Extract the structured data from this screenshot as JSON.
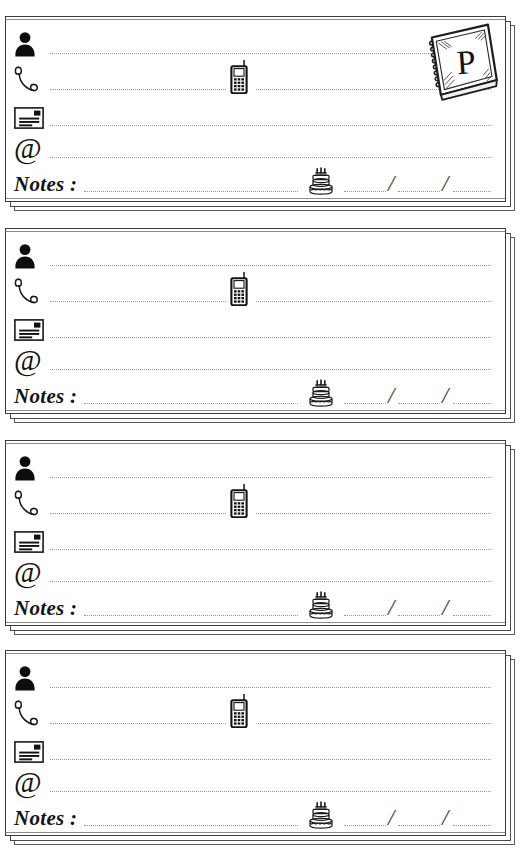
{
  "page": {
    "background_color": "#ffffff",
    "ink_color": "#111111",
    "rule_color": "#9a9a9a",
    "card_count": 4
  },
  "alpha_tab": {
    "letter": "P",
    "icon": "spiral-notebook-icon",
    "shown_on_card_index": 0
  },
  "field_icons": {
    "name": "person-icon",
    "phone": "telephone-handset-icon",
    "mobile": "mobile-phone-icon",
    "address": "envelope-icon",
    "email": "at-sign-icon",
    "birthday": "birthday-cake-icon"
  },
  "email_glyph": "@",
  "notes_label": "Notes :",
  "date_separator": "/",
  "cards": [
    {
      "index": 1,
      "name_value": "",
      "name_placeholder": "",
      "phone_value": "",
      "mobile_value": "",
      "address_value": "",
      "email_value": "",
      "notes_value": "",
      "birthday_day": "",
      "birthday_month": "",
      "birthday_year": "",
      "has_alpha_tab": true
    },
    {
      "index": 2,
      "name_value": "",
      "name_placeholder": "",
      "phone_value": "",
      "mobile_value": "",
      "address_value": "",
      "email_value": "",
      "notes_value": "",
      "birthday_day": "",
      "birthday_month": "",
      "birthday_year": "",
      "has_alpha_tab": false
    },
    {
      "index": 3,
      "name_value": "",
      "name_placeholder": "",
      "phone_value": "",
      "mobile_value": "",
      "address_value": "",
      "email_value": "",
      "notes_value": "",
      "birthday_day": "",
      "birthday_month": "",
      "birthday_year": "",
      "has_alpha_tab": false
    },
    {
      "index": 4,
      "name_value": "",
      "name_placeholder": "",
      "phone_value": "",
      "mobile_value": "",
      "address_value": "",
      "email_value": "",
      "notes_value": "",
      "birthday_day": "",
      "birthday_month": "",
      "birthday_year": "",
      "has_alpha_tab": false
    }
  ],
  "layout": {
    "card_tops": [
      16,
      228,
      440,
      650
    ],
    "card_height": 186,
    "card_left": 5,
    "card_width": 510
  }
}
